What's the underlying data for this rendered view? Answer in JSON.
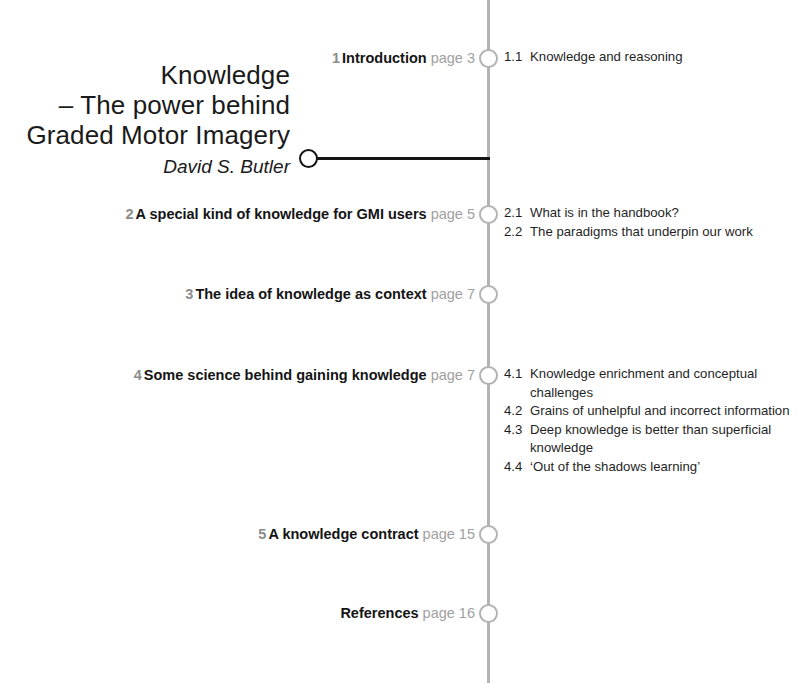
{
  "document": {
    "title_lines": [
      "Knowledge",
      "– The power behind",
      "Graded Motor Imagery"
    ],
    "author": "David S. Butler",
    "page_label": "page"
  },
  "colors": {
    "spine": "#b3b3b3",
    "node_ring": "#b3b3b3",
    "author_accent": "#141414",
    "chapter_number": "#8c8c8c",
    "chapter_title": "#141414",
    "page_number": "#a0a0a0",
    "sub_item": "#1f1f1f",
    "background": "#ffffff"
  },
  "contents": [
    {
      "number": "1",
      "title": "Introduction",
      "page": "page 3",
      "node_y": 58,
      "subitems": [
        {
          "number": "1.1",
          "text": "Knowledge and reasoning"
        }
      ]
    },
    {
      "number": "2",
      "title": "A special kind of knowledge for GMI users",
      "page": "page 5",
      "node_y": 214,
      "subitems": [
        {
          "number": "2.1",
          "text": "What is in the handbook?"
        },
        {
          "number": "2.2",
          "text": "The paradigms that underpin our work"
        }
      ]
    },
    {
      "number": "3",
      "title": "The idea of knowledge as context",
      "page": "page 7",
      "node_y": 294,
      "subitems": []
    },
    {
      "number": "4",
      "title": "Some science behind gaining knowledge",
      "page": "page 7",
      "node_y": 375,
      "subitems": [
        {
          "number": "4.1",
          "text": "Knowledge enrichment and conceptual challenges"
        },
        {
          "number": "4.2",
          "text": "Grains of unhelpful and incorrect information"
        },
        {
          "number": "4.3",
          "text": "Deep knowledge is better than superficial knowledge"
        },
        {
          "number": "4.4",
          "text": "‘Out of the shadows learning’"
        }
      ]
    },
    {
      "number": "5",
      "title": "A knowledge contract",
      "page": "page 15",
      "node_y": 534,
      "subitems": []
    },
    {
      "number": "",
      "title": "References",
      "page": "page 16",
      "node_y": 613,
      "subitems": []
    }
  ]
}
